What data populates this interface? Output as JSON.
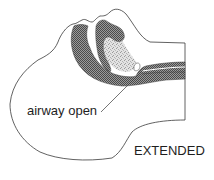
{
  "diagram": {
    "labels": {
      "airway": "airway open",
      "position": "EXTENDED"
    },
    "colors": {
      "outline": "#3a3a3a",
      "hatch_fill": "#6b6b6b",
      "stipple_fill": "#c8c8c8",
      "background": "#ffffff",
      "text": "#1e1e1e"
    }
  }
}
